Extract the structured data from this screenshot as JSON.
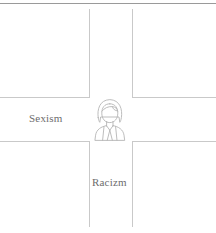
{
  "diagram": {
    "type": "crossroads-intersectionality",
    "background_color": "#ffffff",
    "top_rule_color": "#9a9a9a",
    "road_color": "#c9c9c9",
    "label_color": "#6d6d6d",
    "roads": [
      {
        "id": "horizontal-road",
        "orientation": "horizontal",
        "label": "Sexism",
        "label_position": "left"
      },
      {
        "id": "vertical-road",
        "orientation": "vertical",
        "label": "Racizm",
        "label_position": "bottom"
      }
    ],
    "labels": {
      "horizontal": "Sexism",
      "vertical": "Racizm"
    },
    "center_figure": {
      "icon": "person-avatar-icon",
      "description": "line-art bust of a person with long hair wearing a collared jacket",
      "stroke_color": "#b5b5b5"
    }
  }
}
